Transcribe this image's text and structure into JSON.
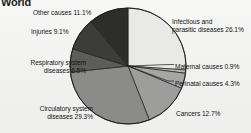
{
  "chart_data": {
    "type": "pie",
    "title": "World",
    "xlabel": "",
    "ylabel": "",
    "legend_position": "none",
    "grid": false,
    "value_unit": "percent",
    "start_angle_deg": 0,
    "direction": "clockwise",
    "categories": [
      "Infectious and parasitic diseases",
      "Maternal causes",
      "Perinatal causes",
      "Cancers",
      "Circulatory system diseases",
      "Respiratory system diseases",
      "Injuries",
      "Other causes"
    ],
    "values": [
      26.1,
      0.9,
      4.3,
      12.7,
      29.3,
      6.5,
      9.1,
      11.1
    ],
    "slices": [
      {
        "name": "infectious-and-parasitic-diseases",
        "label": "Infectious and parasitic diseases 26.1%",
        "label_line1": "Infectious and",
        "label_line2": "parasitic diseases 26.1%",
        "value": 26.1,
        "color": "#e9e9e7"
      },
      {
        "name": "maternal-causes",
        "label": "Maternal causes 0.9%",
        "value": 0.9,
        "color": "#b9b9b7"
      },
      {
        "name": "perinatal-causes",
        "label": "Perinatal causes 4.3%",
        "value": 4.3,
        "color": "#a6a6a4"
      },
      {
        "name": "cancers",
        "label": "Cancers 12.7%",
        "value": 12.7,
        "color": "#9d9d9b"
      },
      {
        "name": "circulatory-system-diseases",
        "label": "Circulatory system diseases 29.3%",
        "label_line1": "Circulatory system",
        "label_line2": "diseases 29.3%",
        "value": 29.3,
        "color": "#8b8b89"
      },
      {
        "name": "respiratory-system-diseases",
        "label": "Respiratory system diseases 6.5%",
        "label_line1": "Respiratory system",
        "label_line2": "diseases 6.5%",
        "value": 6.5,
        "color": "#5c5c5a"
      },
      {
        "name": "injuries",
        "label": "Injuries 9.1%",
        "value": 9.1,
        "color": "#3c3c3a"
      },
      {
        "name": "other-causes",
        "label": "Other causes 11.1%",
        "value": 11.1,
        "color": "#2d2d2b"
      }
    ]
  }
}
